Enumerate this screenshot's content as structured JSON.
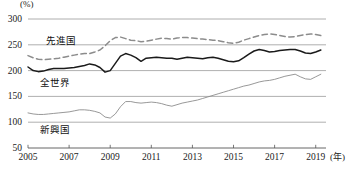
{
  "chart_data": {
    "type": "line",
    "title": "",
    "xlabel": "年",
    "ylabel": "(%)",
    "unit_label": "(%)",
    "year_unit_label": "(年)",
    "ylim": [
      50,
      300
    ],
    "xlim": [
      2005,
      2019.5
    ],
    "grid": true,
    "gridlines": [
      300,
      250,
      200,
      150,
      100
    ],
    "y_ticks": [
      300,
      250,
      200,
      150,
      100,
      50
    ],
    "x_ticks": [
      2005,
      2007,
      2009,
      2011,
      2013,
      2015,
      2017,
      2019
    ],
    "legend_position": "inline-annotations",
    "colors": {
      "advanced": "#8c8c8c",
      "world": "#1a1a1a",
      "emerging": "#8c8c8c",
      "grid": "#9a9a9a",
      "axis": "#555555"
    },
    "series": [
      {
        "name": "先進国",
        "style": "dashed",
        "color": "#8c8c8c",
        "label_x": 2005.9,
        "label_y": 262,
        "x": [
          2005.0,
          2005.25,
          2005.5,
          2005.75,
          2006.0,
          2006.25,
          2006.5,
          2006.75,
          2007.0,
          2007.25,
          2007.5,
          2007.75,
          2008.0,
          2008.25,
          2008.5,
          2008.75,
          2009.0,
          2009.25,
          2009.5,
          2009.75,
          2010.0,
          2010.25,
          2010.5,
          2010.75,
          2011.0,
          2011.25,
          2011.5,
          2011.75,
          2012.0,
          2012.25,
          2012.5,
          2012.75,
          2013.0,
          2013.25,
          2013.5,
          2013.75,
          2014.0,
          2014.25,
          2014.5,
          2014.75,
          2015.0,
          2015.25,
          2015.5,
          2015.75,
          2016.0,
          2016.25,
          2016.5,
          2016.75,
          2017.0,
          2017.25,
          2017.5,
          2017.75,
          2018.0,
          2018.25,
          2018.5,
          2018.75,
          2019.0,
          2019.25
        ],
        "values": [
          229,
          225,
          222,
          221,
          222,
          223,
          224,
          226,
          228,
          230,
          232,
          233,
          233,
          236,
          240,
          248,
          258,
          264,
          265,
          262,
          259,
          258,
          256,
          257,
          259,
          261,
          263,
          262,
          261,
          263,
          264,
          264,
          263,
          262,
          261,
          260,
          259,
          258,
          256,
          254,
          253,
          255,
          259,
          262,
          265,
          268,
          270,
          271,
          270,
          268,
          266,
          265,
          266,
          268,
          270,
          271,
          270,
          268
        ]
      },
      {
        "name": "全世界",
        "style": "solid-bold",
        "color": "#1a1a1a",
        "label_x": 2005.6,
        "label_y": 180,
        "x": [
          2005.0,
          2005.25,
          2005.5,
          2005.75,
          2006.0,
          2006.25,
          2006.5,
          2006.75,
          2007.0,
          2007.25,
          2007.5,
          2007.75,
          2008.0,
          2008.25,
          2008.5,
          2008.75,
          2009.0,
          2009.25,
          2009.5,
          2009.75,
          2010.0,
          2010.25,
          2010.5,
          2010.75,
          2011.0,
          2011.25,
          2011.5,
          2011.75,
          2012.0,
          2012.25,
          2012.5,
          2012.75,
          2013.0,
          2013.25,
          2013.5,
          2013.75,
          2014.0,
          2014.25,
          2014.5,
          2014.75,
          2015.0,
          2015.25,
          2015.5,
          2015.75,
          2016.0,
          2016.25,
          2016.5,
          2016.75,
          2017.0,
          2017.25,
          2017.5,
          2017.75,
          2018.0,
          2018.25,
          2018.5,
          2018.75,
          2019.0,
          2019.25
        ],
        "values": [
          207,
          200,
          198,
          199,
          202,
          204,
          204,
          204,
          205,
          206,
          208,
          210,
          213,
          211,
          206,
          197,
          200,
          214,
          228,
          233,
          230,
          225,
          218,
          224,
          225,
          226,
          225,
          224,
          224,
          222,
          224,
          226,
          225,
          224,
          223,
          225,
          226,
          224,
          221,
          218,
          217,
          219,
          225,
          232,
          238,
          241,
          239,
          236,
          237,
          239,
          240,
          241,
          241,
          238,
          234,
          233,
          236,
          240
        ]
      },
      {
        "name": "新興国",
        "style": "solid-thin",
        "color": "#8c8c8c",
        "label_x": 2005.6,
        "label_y": 88,
        "x": [
          2005.0,
          2005.25,
          2005.5,
          2005.75,
          2006.0,
          2006.25,
          2006.5,
          2006.75,
          2007.0,
          2007.25,
          2007.5,
          2007.75,
          2008.0,
          2008.25,
          2008.5,
          2008.75,
          2009.0,
          2009.25,
          2009.5,
          2009.75,
          2010.0,
          2010.25,
          2010.5,
          2010.75,
          2011.0,
          2011.25,
          2011.5,
          2011.75,
          2012.0,
          2012.25,
          2012.5,
          2012.75,
          2013.0,
          2013.25,
          2013.5,
          2013.75,
          2014.0,
          2014.25,
          2014.5,
          2014.75,
          2015.0,
          2015.25,
          2015.5,
          2015.75,
          2016.0,
          2016.25,
          2016.5,
          2016.75,
          2017.0,
          2017.25,
          2017.5,
          2017.75,
          2018.0,
          2018.25,
          2018.5,
          2018.75,
          2019.0,
          2019.25
        ],
        "values": [
          118,
          116,
          115,
          115,
          116,
          117,
          118,
          119,
          120,
          122,
          124,
          124,
          123,
          121,
          118,
          110,
          108,
          116,
          130,
          140,
          140,
          138,
          137,
          138,
          139,
          138,
          136,
          133,
          131,
          134,
          137,
          139,
          141,
          143,
          146,
          149,
          152,
          155,
          158,
          161,
          164,
          167,
          170,
          172,
          175,
          178,
          180,
          181,
          183,
          186,
          189,
          191,
          193,
          188,
          184,
          183,
          188,
          193
        ]
      }
    ]
  },
  "footer": {
    "caption": ""
  }
}
